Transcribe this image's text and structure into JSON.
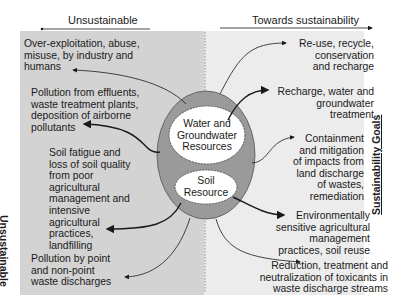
{
  "headers": {
    "left": "Unsustainable",
    "right": "Towards sustainability"
  },
  "side_labels": {
    "left": "Unsustainable",
    "right": "Sustainability Goals"
  },
  "center": {
    "water": [
      "Water and",
      "Groundwater",
      "Resources"
    ],
    "soil": [
      "Soil",
      "Resource"
    ]
  },
  "left_items": [
    {
      "lines": [
        "Over-exploitation, abuse,",
        "misuse, by industry and",
        "humans"
      ]
    },
    {
      "lines": [
        "Pollution from effluents,",
        "waste treatment plants,",
        "deposition of airborne",
        "pollutants"
      ]
    },
    {
      "lines": [
        "Soil fatigue and",
        "loss of soil quality",
        "from poor",
        "agricultural",
        "management and",
        "intensive",
        "agricultural",
        "practices,",
        "landfilling"
      ]
    },
    {
      "lines": [
        "Pollution by point",
        "and non-point",
        "waste discharges"
      ]
    }
  ],
  "right_items": [
    {
      "lines": [
        "Re-use, recycle,",
        "conservation",
        "and recharge"
      ]
    },
    {
      "lines": [
        "Recharge, water and",
        "groundwater",
        "treatment"
      ]
    },
    {
      "lines": [
        "Containment",
        "and mitigation",
        "of impacts from",
        "land discharge",
        "of wastes,",
        "remediation"
      ]
    },
    {
      "lines": [
        "Environmentally",
        "sensitive agricultural",
        "management",
        "practices, soil reuse"
      ]
    },
    {
      "lines": [
        "Reduction, treatment and",
        "neutralization of toxicants in",
        "waste discharge streams"
      ]
    }
  ],
  "colors": {
    "left_panel": "#d3d3d3",
    "right_panel": "#ececec",
    "ring": "#9a9a9a",
    "inner": "#ffffff",
    "line": "#1a1a1a"
  }
}
